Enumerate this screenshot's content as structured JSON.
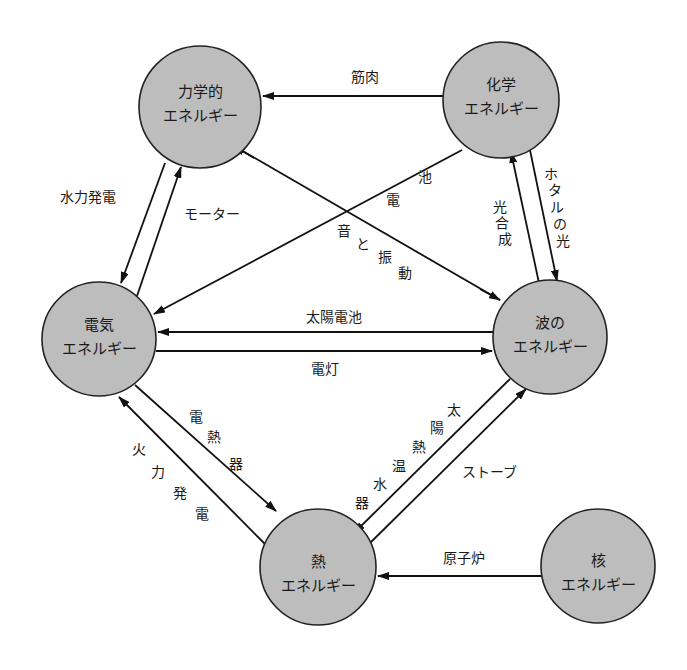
{
  "colors": {
    "node_fill": "#bdbdbd",
    "stroke": "#111111",
    "background": "#ffffff"
  },
  "nodes": {
    "mechanical": {
      "line1": "力学的",
      "line2": "エネルギー"
    },
    "chemical": {
      "line1": "化学",
      "line2": "エネルギー"
    },
    "electric": {
      "line1": "電気",
      "line2": "エネルギー"
    },
    "wave": {
      "line1": "波の",
      "line2": "エネルギー"
    },
    "heat": {
      "line1": "熱",
      "line2": "エネルギー"
    },
    "nuclear": {
      "line1": "核",
      "line2": "エネルギー"
    }
  },
  "edges": {
    "muscle": {
      "label": "筋肉",
      "from": "化学エネルギー",
      "to": "力学的エネルギー"
    },
    "hydro": {
      "label": "水力発電",
      "from": "力学的エネルギー",
      "to": "電気エネルギー"
    },
    "motor": {
      "label": "モーター",
      "from": "電気エネルギー",
      "to": "力学的エネルギー"
    },
    "battery": {
      "label": "電池",
      "chars": [
        "池",
        "電"
      ],
      "from": "化学エネルギー",
      "to": "電気エネルギー"
    },
    "sound": {
      "label": "音と振動",
      "chars": [
        "音",
        "と",
        "振",
        "動"
      ],
      "from": "力学的エネルギー",
      "to": "波のエネルギー"
    },
    "photosynthesis": {
      "label": "光合成",
      "chars": [
        "光",
        "合",
        "成"
      ],
      "from": "波のエネルギー",
      "to": "化学エネルギー"
    },
    "firefly": {
      "label": "ホタルの光",
      "chars": [
        "ホ",
        "タ",
        "ル",
        "の",
        "光"
      ],
      "from": "化学エネルギー",
      "to": "波のエネルギー"
    },
    "solar_cell": {
      "label": "太陽電池",
      "from": "波のエネルギー",
      "to": "電気エネルギー"
    },
    "lamp": {
      "label": "電灯",
      "from": "電気エネルギー",
      "to": "波のエネルギー"
    },
    "heater": {
      "label": "電熱器",
      "chars": [
        "電",
        "熱",
        "器"
      ],
      "from": "電気エネルギー",
      "to": "熱エネルギー"
    },
    "thermal_power": {
      "label": "火力発電",
      "chars": [
        "火",
        "力",
        "発",
        "電"
      ],
      "from": "熱エネルギー",
      "to": "電気エネルギー"
    },
    "solar_water_heater": {
      "label": "太陽熱温水器",
      "chars": [
        "太",
        "陽",
        "熱",
        "温",
        "水",
        "器"
      ],
      "from": "波のエネルギー",
      "to": "熱エネルギー"
    },
    "stove": {
      "label": "ストーブ",
      "from": "熱エネルギー",
      "to": "波のエネルギー"
    },
    "reactor": {
      "label": "原子炉",
      "from": "核エネルギー",
      "to": "熱エネルギー"
    }
  }
}
